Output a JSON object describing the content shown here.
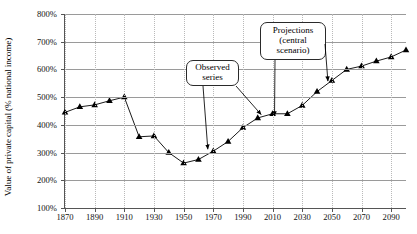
{
  "chart_data": {
    "type": "line",
    "title": "",
    "xlabel": "",
    "ylabel": "Value of private capital (% national income)",
    "xlim": [
      1870,
      2100
    ],
    "ylim": [
      100,
      800
    ],
    "grid": true,
    "legend": "none",
    "y_tick_labels": [
      "800%",
      "700%",
      "600%",
      "500%",
      "400%",
      "300%",
      "200%",
      "100%"
    ],
    "y_tick_values": [
      800,
      700,
      600,
      500,
      400,
      300,
      200,
      100
    ],
    "x_tick_labels": [
      "1870",
      "1890",
      "1910",
      "1930",
      "1950",
      "1970",
      "1990",
      "2010",
      "2030",
      "2050",
      "2070",
      "2090"
    ],
    "x_tick_values": [
      1870,
      1890,
      1910,
      1930,
      1950,
      1970,
      1990,
      2010,
      2030,
      2050,
      2070,
      2090
    ],
    "series": [
      {
        "name": "Value of private capital (% national income)",
        "marker": "triangle",
        "color": "#000000",
        "x": [
          1870,
          1880,
          1890,
          1900,
          1910,
          1920,
          1930,
          1940,
          1950,
          1960,
          1970,
          1980,
          1990,
          2000,
          2010,
          2020,
          2030,
          2040,
          2050,
          2060,
          2070,
          2080,
          2090,
          2100
        ],
        "values": [
          445,
          465,
          472,
          487,
          500,
          357,
          360,
          300,
          262,
          275,
          305,
          340,
          390,
          425,
          440,
          440,
          470,
          520,
          560,
          600,
          612,
          630,
          645,
          670
        ]
      }
    ],
    "annotations": [
      {
        "name": "observed-series",
        "lines": [
          "Observed",
          "series"
        ],
        "arrow_targets": [
          [
            1967,
            312
          ],
          [
            2003,
            437
          ]
        ]
      },
      {
        "name": "projections-central-scenario",
        "lines": [
          "Projections",
          "(central",
          "scenario)"
        ],
        "arrow_targets": [
          [
            2012,
            432
          ],
          [
            2048,
            558
          ]
        ]
      }
    ]
  }
}
